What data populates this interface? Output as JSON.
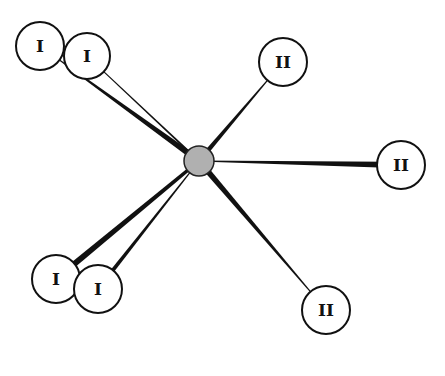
{
  "diagram": {
    "type": "star-network",
    "center": {
      "x": 199,
      "y": 161,
      "r": 15,
      "fill": "#b0b0b0"
    },
    "nodes": [
      {
        "id": "n1",
        "label": "I",
        "x": 40,
        "y": 46,
        "r": 24,
        "edge": {
          "w1": 1,
          "w2": 6
        }
      },
      {
        "id": "n2",
        "label": "I",
        "x": 87,
        "y": 56,
        "r": 23,
        "edge": {
          "w1": 1,
          "w2": 2
        }
      },
      {
        "id": "n3",
        "label": "II",
        "x": 283,
        "y": 62,
        "r": 24,
        "edge": {
          "w1": 1,
          "w2": 5
        }
      },
      {
        "id": "n4",
        "label": "II",
        "x": 401,
        "y": 165,
        "r": 24,
        "edge": {
          "w1": 6,
          "w2": 1
        }
      },
      {
        "id": "n5",
        "label": "I",
        "x": 56,
        "y": 279,
        "r": 24,
        "edge": {
          "w1": 6,
          "w2": 3
        }
      },
      {
        "id": "n6",
        "label": "I",
        "x": 98,
        "y": 289,
        "r": 24,
        "edge": {
          "w1": 4,
          "w2": 1
        }
      },
      {
        "id": "n7",
        "label": "II",
        "x": 326,
        "y": 310,
        "r": 24,
        "edge": {
          "w1": 1,
          "w2": 6
        }
      }
    ]
  }
}
